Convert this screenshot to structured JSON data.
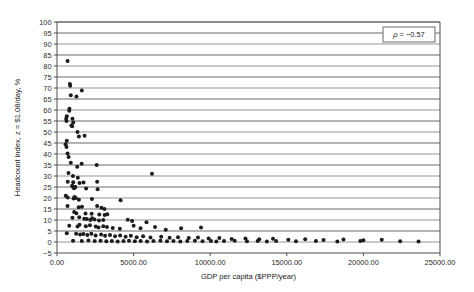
{
  "chart_data": {
    "type": "scatter",
    "title": "",
    "xlabel": "GDP per capita ($PPP/year)",
    "ylabel": "Headcount index, z = $1.08/day, %",
    "xlim": [
      0,
      25000
    ],
    "ylim": [
      -5,
      100
    ],
    "xticks": [
      0,
      5000,
      10000,
      15000,
      20000,
      25000
    ],
    "xtick_labels": [
      "0.00",
      "5000.00",
      "10000.00",
      "15000.00",
      "20000.00",
      "25000.00"
    ],
    "yticks": [
      -5,
      0,
      5,
      10,
      15,
      20,
      25,
      30,
      35,
      40,
      45,
      50,
      55,
      60,
      65,
      70,
      75,
      80,
      85,
      90,
      95,
      100
    ],
    "ytick_labels": [
      "−5",
      "0",
      "5",
      "10",
      "15",
      "20",
      "25",
      "30",
      "35",
      "40",
      "45",
      "50",
      "55",
      "60",
      "65",
      "70",
      "75",
      "80",
      "85",
      "90",
      "95",
      "100"
    ],
    "grid": true,
    "grid_axis": "y",
    "legend": false,
    "annotations": [
      {
        "name": "correlation-annotation",
        "symbol": "ρ",
        "text": " = −0.57",
        "full_text": "ρ = −0.57",
        "value": -0.57,
        "position": "top-right"
      }
    ],
    "marker": {
      "shape": "circle",
      "color": "#1c1c1c",
      "size": 2.0
    },
    "point_count": 163,
    "points": [
      [
        690,
        82.3
      ],
      [
        840,
        71.8
      ],
      [
        860,
        71.0
      ],
      [
        1620,
        68.9
      ],
      [
        900,
        66.7
      ],
      [
        1270,
        66.1
      ],
      [
        810,
        60.6
      ],
      [
        800,
        59.7
      ],
      [
        640,
        57.2
      ],
      [
        600,
        56.0
      ],
      [
        620,
        55.0
      ],
      [
        1010,
        56.0
      ],
      [
        1060,
        54.3
      ],
      [
        940,
        53.0
      ],
      [
        990,
        52.6
      ],
      [
        1340,
        50.0
      ],
      [
        1430,
        48.0
      ],
      [
        1800,
        48.3
      ],
      [
        640,
        46.0
      ],
      [
        560,
        44.4
      ],
      [
        620,
        43.2
      ],
      [
        690,
        40.2
      ],
      [
        760,
        38.6
      ],
      [
        900,
        36.0
      ],
      [
        1610,
        35.6
      ],
      [
        2590,
        35.0
      ],
      [
        1320,
        34.2
      ],
      [
        750,
        31.4
      ],
      [
        1040,
        30.0
      ],
      [
        1360,
        29.2
      ],
      [
        6200,
        31.0
      ],
      [
        700,
        27.4
      ],
      [
        1060,
        27.2
      ],
      [
        1470,
        26.8
      ],
      [
        1730,
        27.0
      ],
      [
        2620,
        27.4
      ],
      [
        990,
        25.6
      ],
      [
        1030,
        25.2
      ],
      [
        1100,
        24.4
      ],
      [
        1170,
        24.8
      ],
      [
        1200,
        25.0
      ],
      [
        1900,
        24.3
      ],
      [
        2650,
        24.0
      ],
      [
        570,
        21.0
      ],
      [
        700,
        20.2
      ],
      [
        1080,
        19.8
      ],
      [
        1140,
        20.4
      ],
      [
        1230,
        20.0
      ],
      [
        1430,
        19.2
      ],
      [
        2280,
        19.5
      ],
      [
        4150,
        19.0
      ],
      [
        690,
        16.4
      ],
      [
        1420,
        15.8
      ],
      [
        1630,
        16.0
      ],
      [
        2620,
        16.4
      ],
      [
        2900,
        15.6
      ],
      [
        3100,
        15.0
      ],
      [
        1120,
        13.6
      ],
      [
        1260,
        13.1
      ],
      [
        1860,
        13.0
      ],
      [
        2260,
        12.8
      ],
      [
        2760,
        12.5
      ],
      [
        3110,
        12.3
      ],
      [
        3280,
        12.6
      ],
      [
        1010,
        11.0
      ],
      [
        1450,
        11.2
      ],
      [
        1780,
        10.6
      ],
      [
        1950,
        10.4
      ],
      [
        2180,
        10.0
      ],
      [
        2290,
        10.8
      ],
      [
        2450,
        10.2
      ],
      [
        2740,
        9.8
      ],
      [
        3020,
        10.0
      ],
      [
        4620,
        10.1
      ],
      [
        4900,
        9.6
      ],
      [
        5840,
        9.0
      ],
      [
        800,
        7.4
      ],
      [
        1340,
        7.0
      ],
      [
        1470,
        7.8
      ],
      [
        1880,
        7.2
      ],
      [
        2150,
        7.6
      ],
      [
        2530,
        7.0
      ],
      [
        2710,
        6.6
      ],
      [
        3020,
        7.2
      ],
      [
        3260,
        6.8
      ],
      [
        3640,
        6.4
      ],
      [
        4100,
        6.0
      ],
      [
        5000,
        7.4
      ],
      [
        5450,
        6.2
      ],
      [
        6400,
        6.8
      ],
      [
        7100,
        5.6
      ],
      [
        8100,
        6.3
      ],
      [
        9400,
        6.6
      ],
      [
        640,
        4.0
      ],
      [
        1250,
        3.8
      ],
      [
        1510,
        3.4
      ],
      [
        1720,
        3.6
      ],
      [
        1980,
        3.2
      ],
      [
        2240,
        3.8
      ],
      [
        2520,
        3.0
      ],
      [
        2880,
        3.4
      ],
      [
        3140,
        2.8
      ],
      [
        3460,
        3.2
      ],
      [
        3790,
        2.6
      ],
      [
        4120,
        3.0
      ],
      [
        4480,
        2.4
      ],
      [
        4820,
        2.8
      ],
      [
        5200,
        2.2
      ],
      [
        5620,
        2.6
      ],
      [
        6100,
        2.0
      ],
      [
        6800,
        2.4
      ],
      [
        7350,
        1.9
      ],
      [
        7900,
        2.2
      ],
      [
        8600,
        1.8
      ],
      [
        9200,
        2.0
      ],
      [
        9900,
        1.6
      ],
      [
        10600,
        1.8
      ],
      [
        11400,
        1.4
      ],
      [
        12300,
        1.6
      ],
      [
        13200,
        1.2
      ],
      [
        14100,
        1.5
      ],
      [
        15100,
        1.0
      ],
      [
        16200,
        1.3
      ],
      [
        17400,
        0.9
      ],
      [
        18700,
        1.1
      ],
      [
        20000,
        0.8
      ],
      [
        21200,
        1.0
      ],
      [
        1050,
        0.6
      ],
      [
        1620,
        0.5
      ],
      [
        2050,
        0.7
      ],
      [
        2460,
        0.4
      ],
      [
        2840,
        0.6
      ],
      [
        3220,
        0.3
      ],
      [
        3580,
        0.5
      ],
      [
        3960,
        0.2
      ],
      [
        4340,
        0.4
      ],
      [
        4700,
        0.6
      ],
      [
        5080,
        0.3
      ],
      [
        5460,
        0.5
      ],
      [
        5880,
        0.2
      ],
      [
        6300,
        0.4
      ],
      [
        6750,
        0.6
      ],
      [
        7180,
        0.3
      ],
      [
        7600,
        0.5
      ],
      [
        8050,
        0.2
      ],
      [
        8500,
        0.4
      ],
      [
        9000,
        0.6
      ],
      [
        9500,
        0.3
      ],
      [
        10050,
        0.5
      ],
      [
        10400,
        0.2
      ],
      [
        10900,
        0.4
      ],
      [
        11600,
        0.6
      ],
      [
        12400,
        0.3
      ],
      [
        13100,
        0.5
      ],
      [
        13700,
        0.2
      ],
      [
        14300,
        0.4
      ],
      [
        15600,
        0.3
      ],
      [
        16900,
        0.5
      ],
      [
        18300,
        0.2
      ],
      [
        19800,
        0.4
      ],
      [
        22400,
        0.3
      ],
      [
        23600,
        0.2
      ]
    ]
  }
}
